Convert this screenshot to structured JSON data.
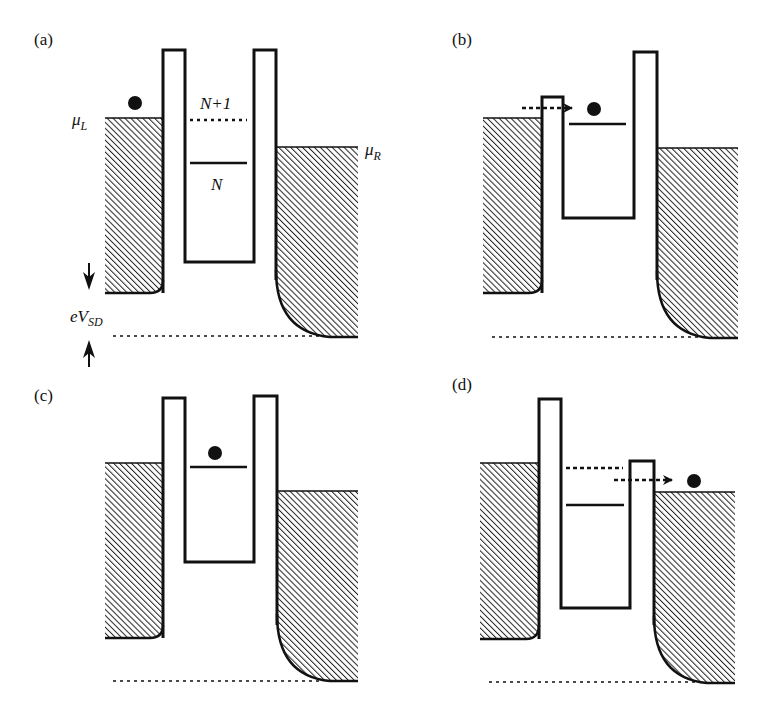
{
  "figure": {
    "colors": {
      "ink": "#111111",
      "background": "#ffffff"
    },
    "panels": [
      {
        "label": "(a)",
        "annotations": {
          "mu_left": "μ",
          "mu_left_sub": "L",
          "mu_right": "μ",
          "mu_right_sub": "R",
          "level_upper": "N+1",
          "level_lower": "N",
          "bias_e": "eV",
          "bias_sub": "SD"
        }
      },
      {
        "label": "(b)"
      },
      {
        "label": "(c)"
      },
      {
        "label": "(d)"
      }
    ]
  }
}
